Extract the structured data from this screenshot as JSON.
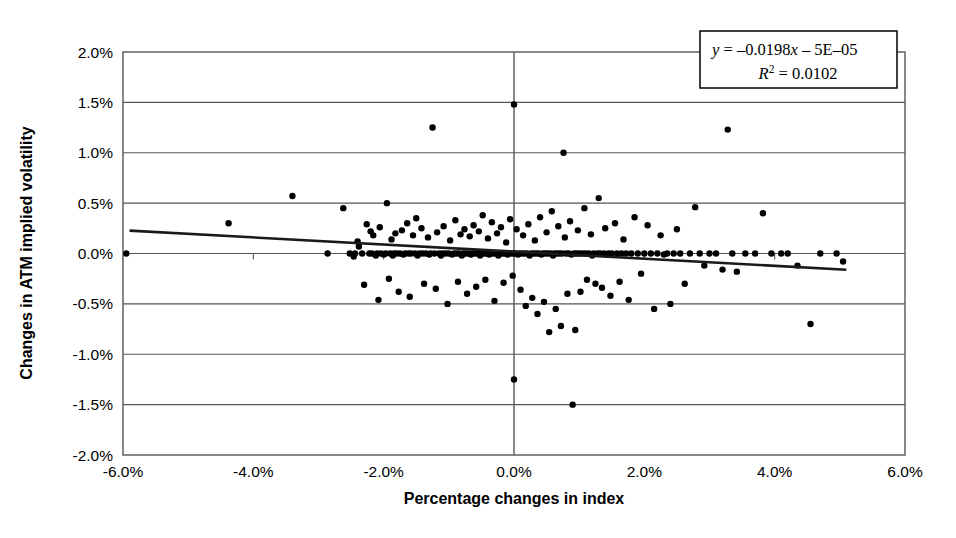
{
  "chart_data": {
    "type": "scatter",
    "title": "",
    "xlabel": "Percentage changes in index",
    "ylabel": "Changes in ATM implied volatility",
    "xlim": [
      -6.0,
      6.0
    ],
    "ylim": [
      -2.0,
      2.0
    ],
    "xticks": [
      "-6.0%",
      "-4.0%",
      "-2.0%",
      "0.0%",
      "2.0%",
      "4.0%",
      "6.0%"
    ],
    "xtick_values": [
      -6.0,
      -4.0,
      -2.0,
      0.0,
      2.0,
      4.0,
      6.0
    ],
    "yticks": [
      "2.0%",
      "1.5%",
      "1.0%",
      "0.5%",
      "0.0%",
      "-0.5%",
      "-1.0%",
      "-1.5%",
      "-2.0%"
    ],
    "ytick_values": [
      2.0,
      1.5,
      1.0,
      0.5,
      0.0,
      -0.5,
      -1.0,
      -1.5,
      -2.0
    ],
    "grid": "horizontal",
    "grid_color": "#555555",
    "legend": "none",
    "marker_color": "#000000",
    "marker_size": 3.2,
    "trendline": {
      "slope": -0.0198,
      "intercept": -5e-05,
      "x_start": -5.9,
      "x_end": 5.1,
      "color": "#1a1a1a",
      "width": 2.6
    },
    "annotation": {
      "equation": "y = –0.0198x – 5E–05",
      "r_squared": "R² = 0.0102",
      "equation_parts": {
        "y": "y",
        "eq_body": " = –0.0198",
        "x": "x",
        "tail": " – 5E–05"
      },
      "r_parts": {
        "r": "R",
        "sup": "2",
        "value": " = 0.0102"
      },
      "box_border": "#000000"
    },
    "points": [
      [
        -5.95,
        0.0
      ],
      [
        -4.38,
        0.3
      ],
      [
        -3.4,
        0.57
      ],
      [
        -2.86,
        0.0
      ],
      [
        -2.62,
        0.45
      ],
      [
        -2.52,
        0.0
      ],
      [
        -2.46,
        -0.03
      ],
      [
        -2.44,
        0.0
      ],
      [
        -2.4,
        0.12
      ],
      [
        -2.38,
        0.07
      ],
      [
        -2.33,
        0.0
      ],
      [
        -2.3,
        -0.31
      ],
      [
        -2.26,
        0.29
      ],
      [
        -2.22,
        0.0
      ],
      [
        -2.2,
        0.22
      ],
      [
        -2.18,
        0.0
      ],
      [
        -2.16,
        0.18
      ],
      [
        -2.12,
        -0.02
      ],
      [
        -2.1,
        0.0
      ],
      [
        -2.08,
        -0.46
      ],
      [
        -2.06,
        0.26
      ],
      [
        -2.04,
        0.0
      ],
      [
        -2.0,
        -0.01
      ],
      [
        -1.97,
        0.0
      ],
      [
        -1.95,
        0.5
      ],
      [
        -1.92,
        -0.25
      ],
      [
        -1.9,
        0.0
      ],
      [
        -1.88,
        0.14
      ],
      [
        -1.86,
        -0.02
      ],
      [
        -1.84,
        0.0
      ],
      [
        -1.82,
        0.2
      ],
      [
        -1.8,
        0.0
      ],
      [
        -1.77,
        -0.38
      ],
      [
        -1.75,
        0.0
      ],
      [
        -1.72,
        0.23
      ],
      [
        -1.7,
        -0.01
      ],
      [
        -1.67,
        0.0
      ],
      [
        -1.64,
        0.3
      ],
      [
        -1.62,
        0.0
      ],
      [
        -1.6,
        -0.43
      ],
      [
        -1.58,
        0.0
      ],
      [
        -1.55,
        0.18
      ],
      [
        -1.52,
        0.0
      ],
      [
        -1.5,
        0.35
      ],
      [
        -1.48,
        -0.02
      ],
      [
        -1.45,
        0.0
      ],
      [
        -1.42,
        0.25
      ],
      [
        -1.4,
        0.0
      ],
      [
        -1.38,
        -0.3
      ],
      [
        -1.35,
        0.0
      ],
      [
        -1.32,
        0.16
      ],
      [
        -1.3,
        -0.01
      ],
      [
        -1.28,
        0.0
      ],
      [
        -1.25,
        1.25
      ],
      [
        -1.22,
        0.0
      ],
      [
        -1.2,
        -0.35
      ],
      [
        -1.18,
        0.21
      ],
      [
        -1.15,
        0.0
      ],
      [
        -1.12,
        -0.02
      ],
      [
        -1.1,
        0.0
      ],
      [
        -1.08,
        0.27
      ],
      [
        -1.05,
        0.0
      ],
      [
        -1.02,
        -0.5
      ],
      [
        -1.0,
        0.0
      ],
      [
        -0.98,
        0.13
      ],
      [
        -0.95,
        -0.01
      ],
      [
        -0.92,
        0.0
      ],
      [
        -0.9,
        0.33
      ],
      [
        -0.88,
        0.0
      ],
      [
        -0.86,
        -0.28
      ],
      [
        -0.84,
        0.0
      ],
      [
        -0.82,
        0.19
      ],
      [
        -0.8,
        -0.02
      ],
      [
        -0.78,
        0.0
      ],
      [
        -0.76,
        0.24
      ],
      [
        -0.74,
        0.0
      ],
      [
        -0.72,
        -0.4
      ],
      [
        -0.7,
        0.0
      ],
      [
        -0.68,
        0.17
      ],
      [
        -0.66,
        -0.01
      ],
      [
        -0.64,
        0.0
      ],
      [
        -0.62,
        0.28
      ],
      [
        -0.6,
        0.0
      ],
      [
        -0.58,
        -0.33
      ],
      [
        -0.56,
        0.0
      ],
      [
        -0.54,
        0.22
      ],
      [
        -0.52,
        -0.02
      ],
      [
        -0.5,
        0.0
      ],
      [
        -0.48,
        0.38
      ],
      [
        -0.46,
        0.0
      ],
      [
        -0.44,
        -0.26
      ],
      [
        -0.42,
        0.0
      ],
      [
        -0.4,
        0.15
      ],
      [
        -0.38,
        -0.01
      ],
      [
        -0.36,
        0.0
      ],
      [
        -0.34,
        0.31
      ],
      [
        -0.32,
        0.0
      ],
      [
        -0.3,
        -0.47
      ],
      [
        -0.28,
        0.0
      ],
      [
        -0.26,
        0.2
      ],
      [
        -0.24,
        -0.02
      ],
      [
        -0.22,
        0.0
      ],
      [
        -0.2,
        0.26
      ],
      [
        -0.18,
        0.0
      ],
      [
        -0.16,
        -0.29
      ],
      [
        -0.14,
        0.0
      ],
      [
        -0.12,
        0.11
      ],
      [
        -0.1,
        -0.01
      ],
      [
        -0.08,
        0.0
      ],
      [
        -0.06,
        0.34
      ],
      [
        -0.04,
        0.0
      ],
      [
        -0.02,
        -0.22
      ],
      [
        0.0,
        0.0
      ],
      [
        0.0,
        1.48
      ],
      [
        0.0,
        -1.25
      ],
      [
        0.02,
        0.0
      ],
      [
        0.04,
        0.24
      ],
      [
        0.06,
        -0.01
      ],
      [
        0.08,
        0.0
      ],
      [
        0.1,
        -0.36
      ],
      [
        0.12,
        0.0
      ],
      [
        0.14,
        0.18
      ],
      [
        0.16,
        0.0
      ],
      [
        0.18,
        -0.52
      ],
      [
        0.2,
        0.0
      ],
      [
        0.22,
        0.29
      ],
      [
        0.24,
        -0.02
      ],
      [
        0.26,
        0.0
      ],
      [
        0.28,
        -0.44
      ],
      [
        0.3,
        0.0
      ],
      [
        0.32,
        0.13
      ],
      [
        0.34,
        0.0
      ],
      [
        0.36,
        -0.6
      ],
      [
        0.38,
        0.0
      ],
      [
        0.4,
        0.36
      ],
      [
        0.42,
        -0.01
      ],
      [
        0.44,
        0.0
      ],
      [
        0.46,
        -0.48
      ],
      [
        0.48,
        0.0
      ],
      [
        0.5,
        0.21
      ],
      [
        0.52,
        0.0
      ],
      [
        0.54,
        -0.78
      ],
      [
        0.56,
        0.0
      ],
      [
        0.58,
        0.42
      ],
      [
        0.6,
        -0.02
      ],
      [
        0.62,
        0.0
      ],
      [
        0.64,
        -0.55
      ],
      [
        0.66,
        0.0
      ],
      [
        0.68,
        0.27
      ],
      [
        0.7,
        0.0
      ],
      [
        0.72,
        -0.72
      ],
      [
        0.74,
        0.0
      ],
      [
        0.76,
        1.0
      ],
      [
        0.78,
        0.16
      ],
      [
        0.8,
        0.0
      ],
      [
        0.82,
        -0.4
      ],
      [
        0.84,
        0.0
      ],
      [
        0.86,
        0.32
      ],
      [
        0.88,
        -0.01
      ],
      [
        0.9,
        -1.5
      ],
      [
        0.92,
        0.0
      ],
      [
        0.94,
        -0.76
      ],
      [
        0.96,
        0.0
      ],
      [
        0.98,
        0.23
      ],
      [
        1.0,
        0.0
      ],
      [
        1.02,
        -0.38
      ],
      [
        1.05,
        0.0
      ],
      [
        1.08,
        0.45
      ],
      [
        1.1,
        0.0
      ],
      [
        1.12,
        -0.26
      ],
      [
        1.15,
        0.0
      ],
      [
        1.18,
        0.19
      ],
      [
        1.2,
        -0.02
      ],
      [
        1.22,
        0.0
      ],
      [
        1.25,
        -0.3
      ],
      [
        1.28,
        0.0
      ],
      [
        1.3,
        0.55
      ],
      [
        1.32,
        0.0
      ],
      [
        1.35,
        -0.34
      ],
      [
        1.38,
        0.0
      ],
      [
        1.4,
        0.25
      ],
      [
        1.42,
        -0.01
      ],
      [
        1.45,
        0.0
      ],
      [
        1.48,
        -0.42
      ],
      [
        1.5,
        0.0
      ],
      [
        1.55,
        0.3
      ],
      [
        1.58,
        0.0
      ],
      [
        1.62,
        -0.28
      ],
      [
        1.65,
        0.0
      ],
      [
        1.68,
        0.14
      ],
      [
        1.72,
        0.0
      ],
      [
        1.76,
        -0.46
      ],
      [
        1.8,
        0.0
      ],
      [
        1.85,
        0.36
      ],
      [
        1.9,
        0.0
      ],
      [
        1.95,
        -0.2
      ],
      [
        2.0,
        0.0
      ],
      [
        2.05,
        0.28
      ],
      [
        2.1,
        0.0
      ],
      [
        2.15,
        -0.55
      ],
      [
        2.2,
        0.0
      ],
      [
        2.25,
        0.18
      ],
      [
        2.3,
        -0.01
      ],
      [
        2.35,
        0.0
      ],
      [
        2.4,
        -0.5
      ],
      [
        2.45,
        0.0
      ],
      [
        2.5,
        0.24
      ],
      [
        2.55,
        0.0
      ],
      [
        2.62,
        -0.3
      ],
      [
        2.7,
        0.0
      ],
      [
        2.78,
        0.46
      ],
      [
        2.85,
        0.0
      ],
      [
        2.92,
        -0.12
      ],
      [
        3.0,
        0.0
      ],
      [
        3.1,
        0.0
      ],
      [
        3.2,
        -0.16
      ],
      [
        3.28,
        1.23
      ],
      [
        3.35,
        0.0
      ],
      [
        3.42,
        -0.18
      ],
      [
        3.55,
        0.0
      ],
      [
        3.7,
        0.0
      ],
      [
        3.82,
        0.4
      ],
      [
        3.95,
        0.0
      ],
      [
        4.1,
        0.0
      ],
      [
        4.2,
        0.0
      ],
      [
        4.35,
        -0.12
      ],
      [
        4.55,
        -0.7
      ],
      [
        4.7,
        0.0
      ],
      [
        4.95,
        0.0
      ],
      [
        5.05,
        -0.08
      ]
    ]
  }
}
